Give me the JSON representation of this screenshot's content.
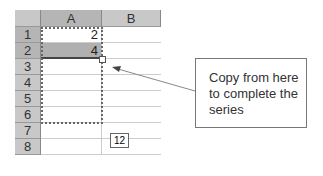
{
  "spreadsheet": {
    "columns": [
      "A",
      "B"
    ],
    "rows": [
      "1",
      "2",
      "3",
      "4",
      "5",
      "6",
      "7",
      "8"
    ],
    "cells": {
      "A1": "2",
      "A2": "4"
    },
    "fill_tooltip": "12"
  },
  "callout": {
    "line1": "Copy from here",
    "line2": "to complete the",
    "line3": "series"
  }
}
